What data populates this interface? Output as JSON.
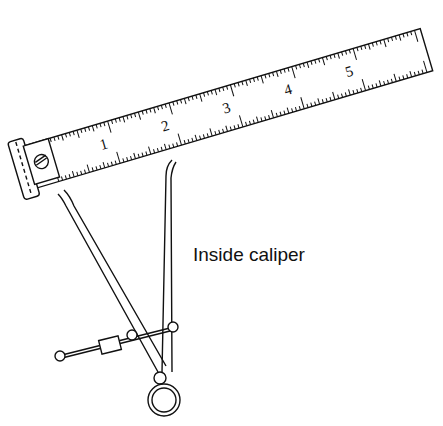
{
  "figure": {
    "label": "Inside caliper",
    "ruler": {
      "numbers": [
        "1",
        "2",
        "3",
        "4",
        "5"
      ]
    }
  }
}
